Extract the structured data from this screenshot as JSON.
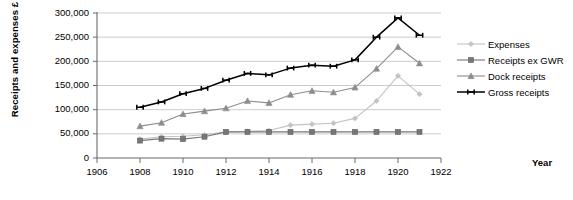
{
  "chart_data": {
    "type": "line",
    "title": "",
    "xlabel": "Year",
    "ylabel": "Receipts and expenses £",
    "xlim": [
      1906,
      1922
    ],
    "ylim": [
      0,
      300000
    ],
    "grid": true,
    "legend_position": "right",
    "x_ticks": [
      "1906",
      "1908",
      "1910",
      "1912",
      "1914",
      "1916",
      "1918",
      "1920",
      "1922"
    ],
    "y_ticks": [
      "0",
      "50,000",
      "100,000",
      "150,000",
      "200,000",
      "250,000",
      "300,000"
    ],
    "x": [
      1908,
      1909,
      1910,
      1911,
      1912,
      1913,
      1914,
      1915,
      1916,
      1917,
      1918,
      1919,
      1920,
      1921
    ],
    "series": [
      {
        "name": "Expenses",
        "color": "#c3c3c3",
        "marker": "diamond",
        "values": [
          39000,
          44000,
          45000,
          48000,
          54000,
          55000,
          57000,
          68000,
          70000,
          72000,
          82000,
          118000,
          170000,
          132000
        ]
      },
      {
        "name": "Receipts ex GWR",
        "color": "#777777",
        "marker": "square",
        "values": [
          36000,
          40000,
          39000,
          44000,
          54000,
          54000,
          54000,
          54000,
          54000,
          54000,
          54000,
          54000,
          54000,
          54000
        ]
      },
      {
        "name": "Dock receipts",
        "color": "#8d8d8d",
        "marker": "triangle",
        "values": [
          66000,
          73000,
          91000,
          97000,
          103000,
          118000,
          114000,
          131000,
          139000,
          136000,
          146000,
          185000,
          230000,
          196000
        ]
      },
      {
        "name": "Gross receipts",
        "color": "#000000",
        "marker": "bowtie",
        "values": [
          105000,
          116000,
          133000,
          144000,
          161000,
          175000,
          172000,
          186000,
          192000,
          190000,
          203000,
          250000,
          290000,
          254000
        ]
      }
    ]
  },
  "legend": {
    "items": [
      {
        "label": "Expenses"
      },
      {
        "label": "Receipts ex GWR"
      },
      {
        "label": "Dock receipts"
      },
      {
        "label": "Gross receipts"
      }
    ]
  },
  "axes": {
    "y_title": "Receipts and expenses £",
    "x_title": "Year"
  }
}
